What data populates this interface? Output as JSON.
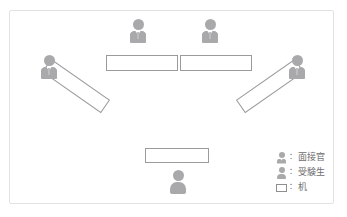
{
  "diagram": {
    "frame": {
      "x": 9,
      "y": 10,
      "width": 325,
      "height": 194
    },
    "colors": {
      "figure": "#a9a9ab",
      "desk_stroke": "#9b9b9d",
      "frame_stroke": "#e2e2e4",
      "text": "#6e6e70",
      "background": "#ffffff"
    },
    "people": [
      {
        "role": "interviewer",
        "position": "top-left-seat",
        "x": 127,
        "y": 19,
        "rotation": 0
      },
      {
        "role": "interviewer",
        "position": "top-right-seat",
        "x": 199,
        "y": 19,
        "rotation": 0
      },
      {
        "role": "interviewer",
        "position": "left-seat",
        "x": 38,
        "y": 55,
        "rotation": 0
      },
      {
        "role": "interviewer",
        "position": "right-seat",
        "x": 286,
        "y": 55,
        "rotation": 0
      },
      {
        "role": "examinee",
        "position": "bottom-seat",
        "x": 167,
        "y": 170,
        "rotation": 0
      }
    ],
    "desks": [
      {
        "name": "top-left-desk",
        "x": 106,
        "y": 55,
        "width": 72,
        "height": 16,
        "rotation": 0
      },
      {
        "name": "top-right-desk",
        "x": 180,
        "y": 55,
        "width": 72,
        "height": 16,
        "rotation": 0
      },
      {
        "name": "left-desk",
        "x": 40,
        "y": 78,
        "width": 72,
        "height": 16,
        "rotation": 35
      },
      {
        "name": "right-desk",
        "x": 234,
        "y": 78,
        "width": 72,
        "height": 16,
        "rotation": -35
      },
      {
        "name": "bottom-desk",
        "x": 145,
        "y": 148,
        "width": 64,
        "height": 15,
        "rotation": 0
      }
    ]
  },
  "legend": {
    "separator": "：",
    "items": [
      {
        "icon": "interviewer-figure-icon",
        "label": "面接官"
      },
      {
        "icon": "examinee-figure-icon",
        "label": "受験生"
      },
      {
        "icon": "desk-rectangle-icon",
        "label": "机"
      }
    ]
  }
}
